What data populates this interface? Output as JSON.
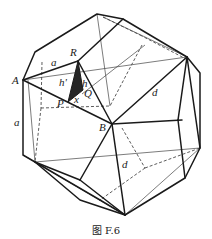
{
  "figure": {
    "caption": "图 F.6"
  },
  "labels": {
    "A": "A",
    "R": "R",
    "P": "P",
    "Q": "Q",
    "B": "B",
    "a_top": "a",
    "a_left": "a",
    "h_prime": "h'",
    "h": "h",
    "x": "x",
    "d_upper": "d",
    "d_lower": "d"
  },
  "colors": {
    "line": "#1a1a1a",
    "shade": "#262626",
    "background": "#ffffff"
  }
}
